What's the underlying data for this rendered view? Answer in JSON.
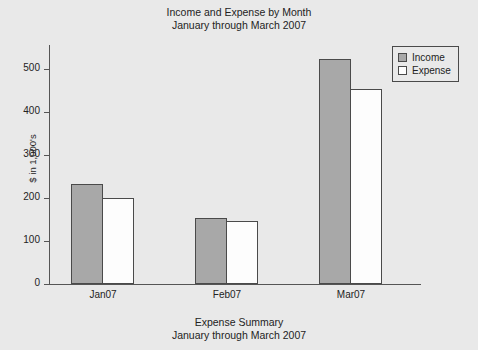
{
  "chart_data": {
    "type": "bar",
    "title": "Income and Expense by Month\nJanuary through March 2007",
    "title_line1": "Income and Expense by Month",
    "title_line2": "January through March 2007",
    "caption_line1": "Expense Summary",
    "caption_line2": "January through March 2007",
    "xlabel": "",
    "ylabel": "$ in 1,000's",
    "categories": [
      "Jan07",
      "Feb07",
      "Mar07"
    ],
    "series": [
      {
        "name": "Income",
        "values": [
          235,
          155,
          528
        ]
      },
      {
        "name": "Expense",
        "values": [
          202,
          148,
          458
        ]
      }
    ],
    "ylim": [
      0,
      560
    ],
    "yticks": [
      0,
      100,
      200,
      300,
      400,
      500
    ],
    "ytick_labels": [
      "0",
      "100",
      "200",
      "300",
      "400",
      "500"
    ],
    "grid": false,
    "legend_position": "top-right",
    "colors": {
      "income_fill": "#a8a8a8",
      "expense_fill": "#fdfdfd",
      "bar_border": "#4a4a4a",
      "axis": "#555555",
      "background": "#e9e9e9",
      "text": "#232323"
    }
  },
  "legend": {
    "entries": [
      {
        "label": "Income"
      },
      {
        "label": "Expense"
      }
    ]
  }
}
